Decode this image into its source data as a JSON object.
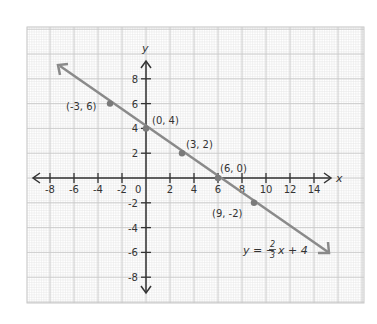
{
  "graph": {
    "x_axis_label": "x",
    "y_axis_label": "y",
    "origin_label": "0",
    "x_ticks": [
      {
        "v": -8,
        "label": "-8"
      },
      {
        "v": -6,
        "label": "-6"
      },
      {
        "v": -4,
        "label": "-4"
      },
      {
        "v": -2,
        "label": "-2"
      },
      {
        "v": 2,
        "label": "2"
      },
      {
        "v": 4,
        "label": "4"
      },
      {
        "v": 6,
        "label": "6"
      },
      {
        "v": 8,
        "label": "8"
      },
      {
        "v": 10,
        "label": "10"
      },
      {
        "v": 12,
        "label": "12"
      },
      {
        "v": 14,
        "label": "14"
      }
    ],
    "y_ticks": [
      {
        "v": 8,
        "label": "8"
      },
      {
        "v": 6,
        "label": "6"
      },
      {
        "v": 4,
        "label": "4"
      },
      {
        "v": 2,
        "label": "2"
      },
      {
        "v": -2,
        "label": "-2"
      },
      {
        "v": -4,
        "label": "-4"
      },
      {
        "v": -6,
        "label": "-6"
      },
      {
        "v": -8,
        "label": "-8"
      }
    ],
    "points": [
      {
        "x": -3,
        "y": 6,
        "label": "(-3, 6)"
      },
      {
        "x": 0,
        "y": 4,
        "label": "(0, 4)"
      },
      {
        "x": 3,
        "y": 2,
        "label": "(3, 2)"
      },
      {
        "x": 6,
        "y": 0,
        "label": "(6, 0)"
      },
      {
        "x": 9,
        "y": -2,
        "label": "(9, -2)"
      }
    ],
    "equation": {
      "lhs": "y = −",
      "numerator": "2",
      "denominator": "3",
      "rhs": "x + 4"
    },
    "colors": {
      "line": "#8a8a8a",
      "axis": "#333333",
      "grid_major": "#c8c8c8",
      "grid_minor": "#e6e6e6",
      "point": "#7a7a7a"
    }
  },
  "chart_data": {
    "type": "line",
    "title": "",
    "xlabel": "x",
    "ylabel": "y",
    "xlim": [
      -10,
      16
    ],
    "ylim": [
      -10,
      10
    ],
    "grid": true,
    "series": [
      {
        "name": "y = -2/3x + 4",
        "x": [
          -3,
          0,
          3,
          6,
          9
        ],
        "y": [
          6,
          4,
          2,
          0,
          -2
        ]
      }
    ],
    "x_tick_labels": [
      "-8",
      "-6",
      "-4",
      "-2",
      "0",
      "2",
      "4",
      "6",
      "8",
      "10",
      "12",
      "14"
    ],
    "y_tick_labels": [
      "-8",
      "-6",
      "-4",
      "-2",
      "2",
      "4",
      "6",
      "8"
    ],
    "annotations": [
      "(-3, 6)",
      "(0, 4)",
      "(3, 2)",
      "(6, 0)",
      "(9, -2)",
      "y = -2/3x + 4"
    ]
  }
}
